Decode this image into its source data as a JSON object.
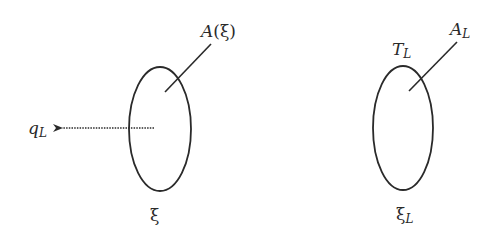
{
  "diagram": {
    "left_region": {
      "name": "ξ",
      "label": "ξ",
      "surface_label": "A(ξ)",
      "surface_label_parts": {
        "base": "A",
        "open": "(",
        "arg": "ξ",
        "close": ")"
      },
      "arrow_label": {
        "base": "q",
        "subscript": "L"
      },
      "arrow_style": "dotted",
      "arrow_direction": "left"
    },
    "right_region": {
      "name": "ξ_L",
      "label": {
        "base": "ξ",
        "subscript": "L"
      },
      "surface_label": {
        "base": "A",
        "subscript": "L"
      },
      "boundary_label": {
        "base": "T",
        "subscript": "L"
      }
    },
    "colors": {
      "stroke": "#2a2a2a",
      "background": "#ffffff"
    }
  }
}
